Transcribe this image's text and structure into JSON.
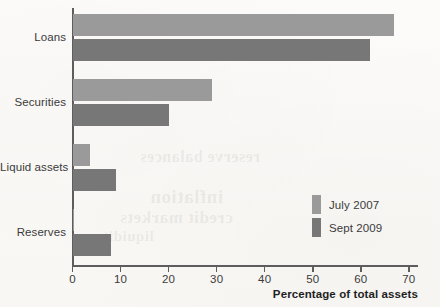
{
  "chart_data": {
    "type": "bar",
    "orientation": "horizontal",
    "title": "",
    "xlabel": "Percentage of total assets",
    "ylabel": "",
    "xlim": [
      0,
      72
    ],
    "grid": false,
    "legend_position": "inside-right",
    "categories": [
      "Loans",
      "Securities",
      "Liquid assets",
      "Reserves"
    ],
    "xticks": [
      0,
      10,
      20,
      30,
      40,
      50,
      60,
      70
    ],
    "xticklabels": [
      "0",
      "10",
      "20",
      "30",
      "40",
      "50",
      "60",
      "70"
    ],
    "series": [
      {
        "name": "July 2007",
        "color": "#9a9a9a",
        "values": [
          67,
          29,
          3.7,
          0.4
        ]
      },
      {
        "name": "Sept 2009",
        "color": "#777777",
        "values": [
          62,
          20,
          9,
          8
        ]
      }
    ]
  },
  "legend": {
    "items": [
      {
        "label": "July 2007",
        "color": "#9a9a9a"
      },
      {
        "label": "Sept 2009",
        "color": "#777777"
      }
    ]
  },
  "bleed_through": {
    "lines": [
      "inflation",
      "credit markets",
      "reserve balances",
      "liquidity"
    ]
  }
}
